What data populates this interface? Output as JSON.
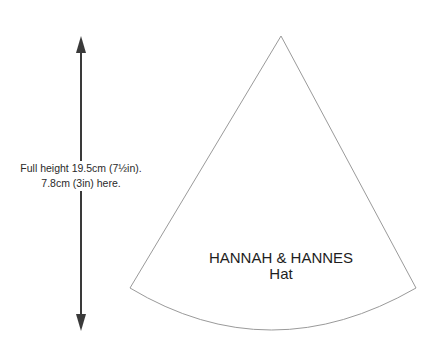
{
  "diagram": {
    "title_line1": "HANNAH & HANNES",
    "title_line2": "Hat",
    "note_line1": "Full height 19.5cm (7½in).",
    "note_line2": "7.8cm (3in) here.",
    "arrow_color": "#3a3a3a",
    "outline_color": "#9a9a9a"
  }
}
